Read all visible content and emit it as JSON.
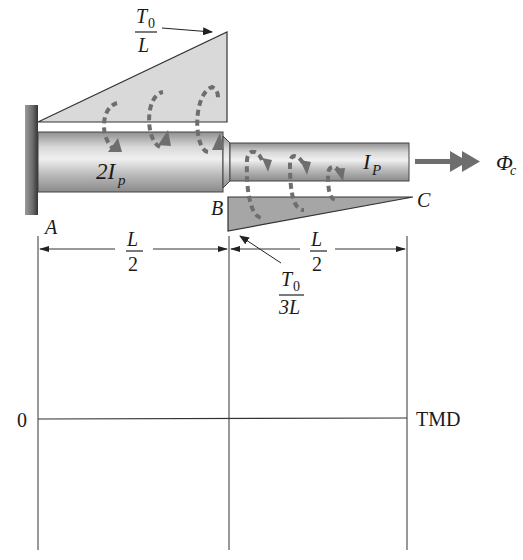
{
  "figure": {
    "loads": {
      "upper_intensity": {
        "numerator": "T",
        "numerator_sub": "0",
        "denominator": "L"
      },
      "lower_intensity": {
        "numerator": "T",
        "numerator_sub": "0",
        "denominator": "3L"
      }
    },
    "shafts": {
      "AB": {
        "label": "2I",
        "sub": "p"
      },
      "BC": {
        "label": "I",
        "sub": "P"
      }
    },
    "points": {
      "A": "A",
      "B": "B",
      "C": "C"
    },
    "rotation": {
      "symbol": "Φ",
      "sub": "c"
    },
    "dimensions": {
      "AB": {
        "numerator": "L",
        "denominator": "2"
      },
      "BC": {
        "numerator": "L",
        "denominator": "2"
      }
    },
    "tmd_axis": {
      "zero_label": "0",
      "axis_label": "TMD"
    },
    "colors": {
      "load_upper_fill": "#d9d9d9",
      "load_lower_fill": "#a6a6a6",
      "shaft_light": "#e6e6e6",
      "shaft_dark": "#9a9a9a",
      "wall": "#5a5a5a",
      "arrow_gray": "#6e6e6e",
      "line": "#333333"
    }
  }
}
